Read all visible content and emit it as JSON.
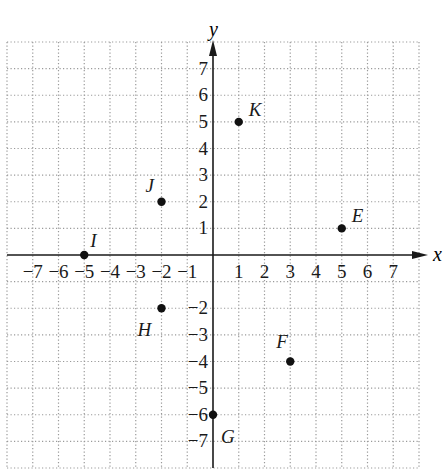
{
  "chart_data": {
    "type": "scatter",
    "title": "",
    "xlabel": "x",
    "ylabel": "y",
    "xlim": [
      -8,
      8
    ],
    "ylim": [
      -8,
      8
    ],
    "grid": true,
    "grid_style": "dotted",
    "x_tick_labels": [
      "−7",
      "−6",
      "−5",
      "−4",
      "−3",
      "−2",
      "−1",
      "1",
      "2",
      "3",
      "4",
      "5",
      "6",
      "7"
    ],
    "x_ticks": [
      -7,
      -6,
      -5,
      -4,
      -3,
      -2,
      -1,
      1,
      2,
      3,
      4,
      5,
      6,
      7
    ],
    "y_tick_labels": [
      "7",
      "6",
      "5",
      "4",
      "3",
      "2",
      "1",
      "−2",
      "−3",
      "−4",
      "−5",
      "−6",
      "−7"
    ],
    "y_ticks": [
      7,
      6,
      5,
      4,
      3,
      2,
      1,
      -2,
      -3,
      -4,
      -5,
      -6,
      -7
    ],
    "points": [
      {
        "label": "K",
        "x": 1,
        "y": 5
      },
      {
        "label": "J",
        "x": -2,
        "y": 2
      },
      {
        "label": "E",
        "x": 5,
        "y": 1
      },
      {
        "label": "I",
        "x": -5,
        "y": 0
      },
      {
        "label": "H",
        "x": -2,
        "y": -2
      },
      {
        "label": "F",
        "x": 3,
        "y": -4
      },
      {
        "label": "G",
        "x": 0,
        "y": -6
      }
    ],
    "colors": {
      "grid": "#9a9a9a",
      "axis": "#1a1a1a",
      "point": "#111111",
      "text": "#1a1a1a"
    }
  }
}
